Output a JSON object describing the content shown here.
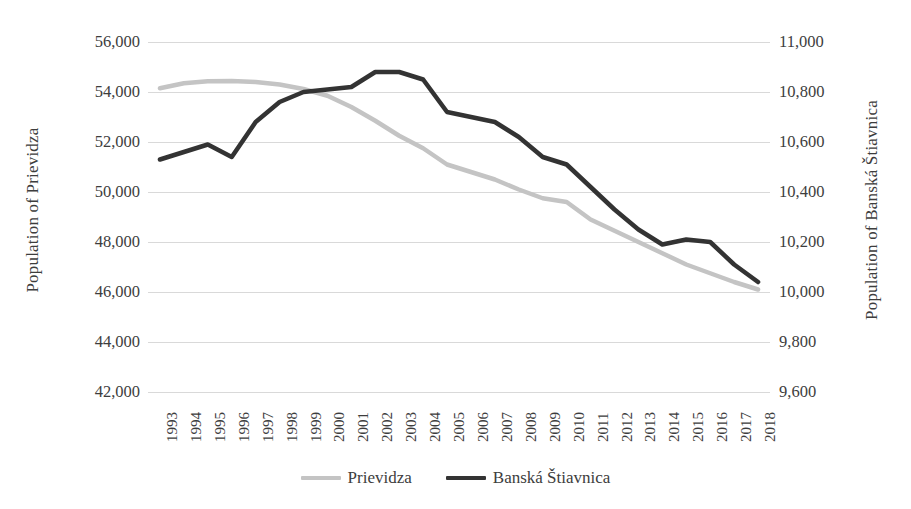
{
  "chart_data": {
    "type": "line",
    "title": "",
    "subtitle": "",
    "xlabel": "",
    "ylabel": "Population of Prievidza",
    "y2label": "Population of Banská Štiavnica",
    "grid": true,
    "legend_position": "bottom",
    "x": [
      1993,
      1994,
      1995,
      1996,
      1997,
      1998,
      1999,
      2000,
      2001,
      2002,
      2003,
      2004,
      2005,
      2006,
      2007,
      2008,
      2009,
      2010,
      2011,
      2012,
      2013,
      2014,
      2015,
      2016,
      2017,
      2018
    ],
    "categories": [
      "1993",
      "1994",
      "1995",
      "1996",
      "1997",
      "1998",
      "1999",
      "2000",
      "2001",
      "2002",
      "2003",
      "2004",
      "2005",
      "2006",
      "2007",
      "2008",
      "2009",
      "2010",
      "2011",
      "2012",
      "2013",
      "2014",
      "2015",
      "2016",
      "2017",
      "2018"
    ],
    "ylim": [
      42000,
      56000
    ],
    "yticks": [
      42000,
      44000,
      46000,
      48000,
      50000,
      52000,
      54000,
      56000
    ],
    "ytick_labels": [
      "42,000",
      "44,000",
      "46,000",
      "48,000",
      "50,000",
      "52,000",
      "54,000",
      "56,000"
    ],
    "y2lim": [
      9600,
      11000
    ],
    "y2ticks": [
      9600,
      9800,
      10000,
      10200,
      10400,
      10600,
      10800,
      11000
    ],
    "y2tick_labels": [
      "9,600",
      "9,800",
      "10,000",
      "10,200",
      "10,400",
      "10,600",
      "10,800",
      "11,000"
    ],
    "series": [
      {
        "name": "Prievidza",
        "axis": "left",
        "color": "#c4c4c4",
        "values": [
          54150,
          54350,
          54430,
          54440,
          54400,
          54300,
          54120,
          53850,
          53400,
          52850,
          52250,
          51750,
          51100,
          50800,
          50500,
          50100,
          49750,
          49600,
          48900,
          48450,
          48000,
          47550,
          47100,
          46750,
          46400,
          46100
        ]
      },
      {
        "name": "Banská Štiavnica",
        "axis": "right",
        "color": "#333333",
        "values": [
          10530,
          10560,
          10590,
          10540,
          10680,
          10760,
          10800,
          10810,
          10820,
          10880,
          10880,
          10850,
          10720,
          10700,
          10680,
          10620,
          10540,
          10510,
          10420,
          10330,
          10250,
          10190,
          10210,
          10200,
          10110,
          10040
        ]
      }
    ]
  },
  "legend": {
    "items": [
      {
        "label": "Prievidza",
        "color": "#c4c4c4"
      },
      {
        "label": "Banská Štiavnica",
        "color": "#333333"
      }
    ]
  },
  "axes": {
    "left_title": "Population of Prievidza",
    "right_title": "Population of Banská Štiavnica"
  }
}
